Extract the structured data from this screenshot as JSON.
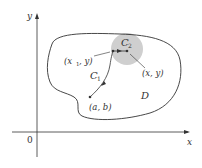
{
  "diagram": {
    "axes": {
      "x_label": "x",
      "y_label": "y",
      "origin_label": "0"
    },
    "region_label": "D",
    "disk_color": "#d0d0d0",
    "curve_labels": {
      "c1": "C",
      "c1_sub": "1",
      "c2": "C",
      "c2_sub": "2"
    },
    "points": {
      "start": "(a, b)",
      "mid_x": "(x",
      "mid_sub": "1",
      "mid_rest": ", y)",
      "end": "(x, y)"
    }
  }
}
